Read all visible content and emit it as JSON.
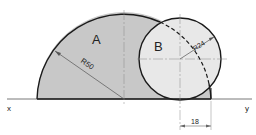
{
  "diagram": {
    "labels": {
      "region_a": "A",
      "region_b": "B",
      "radius_a": "R50",
      "radius_b": "R24",
      "dimension": "18",
      "axis_left": "x",
      "axis_right": "y"
    },
    "colors": {
      "region_a_fill": "#c8c8c8",
      "region_b_fill": "#e6e6e6",
      "outline": "#1a1a1a",
      "centerline": "#888888",
      "background": "#ffffff"
    }
  }
}
